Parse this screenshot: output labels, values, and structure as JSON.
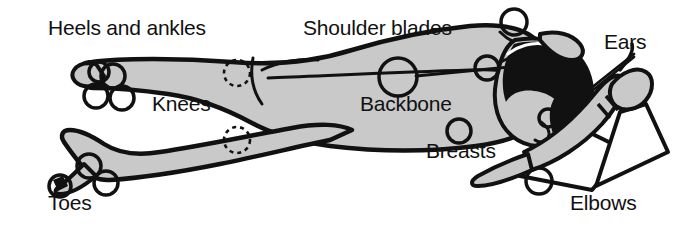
{
  "figure": {
    "colors": {
      "body_fill": "#c9c9c9",
      "outline": "#111111",
      "hair": "#111111",
      "background": "#ffffff",
      "text": "#111111"
    },
    "labels": [
      {
        "id": "heels-and-ankles",
        "text": "Heels and ankles"
      },
      {
        "id": "shoulder-blades",
        "text": "Shoulder blades"
      },
      {
        "id": "ears",
        "text": "Ears"
      },
      {
        "id": "knees",
        "text": "Knees"
      },
      {
        "id": "backbone",
        "text": "Backbone"
      },
      {
        "id": "breasts",
        "text": "Breasts"
      },
      {
        "id": "toes",
        "text": "Toes"
      },
      {
        "id": "elbows",
        "text": "Elbows"
      }
    ],
    "markers": {
      "solid_circles": 12,
      "dashed_circles": 2,
      "dashed_meaning": "knees (contact point on underside, hidden from view)"
    }
  }
}
